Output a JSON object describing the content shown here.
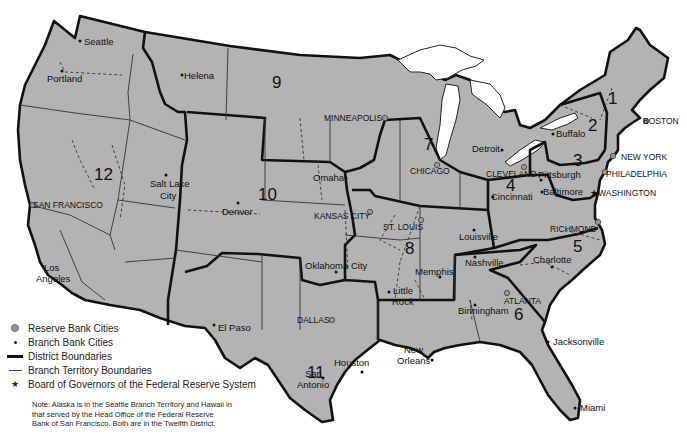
{
  "map": {
    "title": "Federal Reserve System Districts",
    "colors": {
      "land": "#b3b3b3",
      "water": "#ffffff",
      "boundary": "#111111"
    },
    "districts": [
      {
        "number": "1",
        "x": 608,
        "y": 104
      },
      {
        "number": "2",
        "x": 588,
        "y": 131
      },
      {
        "number": "3",
        "x": 578,
        "y": 166
      },
      {
        "number": "4",
        "x": 511,
        "y": 191
      },
      {
        "number": "5",
        "x": 578,
        "y": 247
      },
      {
        "number": "6",
        "x": 519,
        "y": 314
      },
      {
        "number": "7",
        "x": 429,
        "y": 144
      },
      {
        "number": "8",
        "x": 410,
        "y": 248
      },
      {
        "number": "9",
        "x": 273,
        "y": 86
      },
      {
        "number": "10",
        "x": 262,
        "y": 197
      },
      {
        "number": "11",
        "x": 305,
        "y": 387
      },
      {
        "number": "12",
        "x": 99,
        "y": 178
      }
    ],
    "reserve_cities": [
      {
        "label": "BOSTON",
        "x": 612,
        "y": 122
      },
      {
        "label": "NEW YORK",
        "x": 616,
        "y": 158
      },
      {
        "label": "PHILADELPHIA",
        "x": 608,
        "y": 176
      },
      {
        "label": "CLEVELAND",
        "x": 488,
        "y": 176
      },
      {
        "label": "RICHMOND",
        "x": 551,
        "y": 230
      },
      {
        "label": "ATLANTA",
        "x": 526,
        "y": 302
      },
      {
        "label": "CHICAGO",
        "x": 409,
        "y": 173
      },
      {
        "label": "ST. LOUIS",
        "x": 383,
        "y": 230
      },
      {
        "label": "MINNEAPOLIS",
        "x": 325,
        "y": 119
      },
      {
        "label": "KANSAS CITY",
        "x": 314,
        "y": 217
      },
      {
        "label": "DALLAS",
        "x": 300,
        "y": 321
      },
      {
        "label": "SAN FRANCISCO",
        "x": 3,
        "y": 207
      }
    ],
    "branch_cities": [
      {
        "label": "Seattle",
        "x": 86,
        "y": 44
      },
      {
        "label": "Portland",
        "x": 47,
        "y": 80
      },
      {
        "label": "Helena",
        "x": 185,
        "y": 79
      },
      {
        "label": "Salt Lake City",
        "x": 150,
        "y": 185
      },
      {
        "label": "Denver",
        "x": 223,
        "y": 213
      },
      {
        "label": "Omaha",
        "x": 314,
        "y": 181
      },
      {
        "label": "Oklahoma City",
        "x": 305,
        "y": 268
      },
      {
        "label": "Los Angeles",
        "x": 44,
        "y": 270
      },
      {
        "label": "El Paso",
        "x": 218,
        "y": 329
      },
      {
        "label": "Houston",
        "x": 333,
        "y": 364
      },
      {
        "label": "San Antonio",
        "x": 298,
        "y": 375
      },
      {
        "label": "New Orleans",
        "x": 403,
        "y": 355
      },
      {
        "label": "Little Rock",
        "x": 392,
        "y": 292
      },
      {
        "label": "Memphis",
        "x": 415,
        "y": 274
      },
      {
        "label": "Louisville",
        "x": 458,
        "y": 238
      },
      {
        "label": "Nashville",
        "x": 466,
        "y": 264
      },
      {
        "label": "Birmingham",
        "x": 458,
        "y": 312
      },
      {
        "label": "Charlotte",
        "x": 534,
        "y": 262
      },
      {
        "label": "Jacksonville",
        "x": 554,
        "y": 344
      },
      {
        "label": "Miami",
        "x": 580,
        "y": 410
      },
      {
        "label": "Cincinnati",
        "x": 491,
        "y": 199
      },
      {
        "label": "Pittsburgh",
        "x": 539,
        "y": 178
      },
      {
        "label": "Baltimore",
        "x": 543,
        "y": 193
      },
      {
        "label": "Detroit",
        "x": 471,
        "y": 151
      },
      {
        "label": "Buffalo",
        "x": 556,
        "y": 135
      }
    ],
    "board_of_governors": {
      "label": "WASHINGTON",
      "x": 598,
      "y": 194
    }
  },
  "legend": {
    "items": [
      {
        "symbol": "reserve-bank-city",
        "label": "Reserve Bank Cities"
      },
      {
        "symbol": "branch-bank-city",
        "label": "Branch Bank Cities"
      },
      {
        "symbol": "district-boundary",
        "label": "District Boundaries"
      },
      {
        "symbol": "branch-territory-boundary",
        "label": "Branch Territory Boundaries"
      },
      {
        "symbol": "board-of-governors",
        "label": "Board of Governors of the Federal Reserve System"
      }
    ],
    "note": "Note: Alaska is in the Seattle Branch Territory and Hawaii in that served by the Head Office of the Federal Reserve Bank of San Francisco. Both are in the Twelfth District."
  }
}
